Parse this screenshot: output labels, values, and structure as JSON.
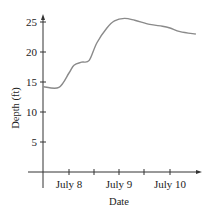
{
  "chart_data": {
    "type": "line",
    "title": "",
    "xlabel": "Date",
    "ylabel": "Depth (ft)",
    "ylim": [
      0,
      26
    ],
    "yticks": [
      5,
      10,
      15,
      20,
      25
    ],
    "xticks": [
      {
        "pos": 8.0,
        "label": "July 8"
      },
      {
        "pos": 8.5,
        "label": ""
      },
      {
        "pos": 9.0,
        "label": "July 9"
      },
      {
        "pos": 9.5,
        "label": ""
      },
      {
        "pos": 10.0,
        "label": "July 10"
      }
    ],
    "grid": false,
    "legend": null,
    "series": [
      {
        "name": "Depth",
        "color": "#8a8a8a",
        "x": [
          7.5,
          7.8,
          8.0,
          8.1,
          8.25,
          8.4,
          8.55,
          8.75,
          8.9,
          9.1,
          9.3,
          9.6,
          9.85,
          10.0,
          10.2,
          10.5
        ],
        "y": [
          14.2,
          14.1,
          16.5,
          17.8,
          18.3,
          18.6,
          21.5,
          24.0,
          25.2,
          25.6,
          25.3,
          24.6,
          24.3,
          24.0,
          23.4,
          23.0
        ]
      }
    ]
  },
  "labels": {
    "y_title": "Depth (ft)",
    "x_title": "Date",
    "y5": "5",
    "y10": "10",
    "y15": "15",
    "y20": "20",
    "y25": "25",
    "x_july8": "July 8",
    "x_july9": "July 9",
    "x_july10": "July 10"
  }
}
